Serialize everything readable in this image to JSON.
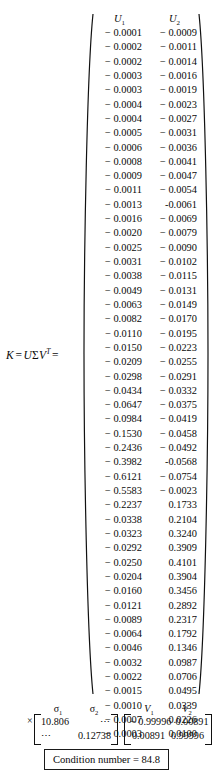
{
  "equation": {
    "label_k": "K",
    "equals": "=",
    "label_u": "U",
    "label_sigma": "Σ",
    "label_v": "V",
    "transpose": "T",
    "equals2": "="
  },
  "u_matrix": {
    "headers": [
      "U",
      "U"
    ],
    "header_subs": [
      "1",
      "2"
    ],
    "rows": [
      [
        "− 0.0001",
        "− 0.0009"
      ],
      [
        "− 0.0002",
        "− 0.0011"
      ],
      [
        "− 0.0002",
        "− 0.0014"
      ],
      [
        "− 0.0003",
        "− 0.0016"
      ],
      [
        "− 0.0003",
        "− 0.0019"
      ],
      [
        "− 0.0004",
        "− 0.0023"
      ],
      [
        "− 0.0004",
        "− 0.0027"
      ],
      [
        "− 0.0005",
        "− 0.0031"
      ],
      [
        "− 0.0006",
        "− 0.0036"
      ],
      [
        "− 0.0008",
        "− 0.0041"
      ],
      [
        "− 0.0009",
        "− 0.0047"
      ],
      [
        "− 0.0011",
        "− 0.0054"
      ],
      [
        "− 0.0013",
        "-0.0061"
      ],
      [
        "− 0.0016",
        "− 0.0069"
      ],
      [
        "− 0.0020",
        "− 0.0079"
      ],
      [
        "− 0.0025",
        "− 0.0090"
      ],
      [
        "− 0.0031",
        "− 0.0102"
      ],
      [
        "− 0.0038",
        "− 0.0115"
      ],
      [
        "− 0.0049",
        "− 0.0131"
      ],
      [
        "− 0.0063",
        "− 0.0149"
      ],
      [
        "− 0.0082",
        "− 0.0170"
      ],
      [
        "− 0.0110",
        "− 0.0195"
      ],
      [
        "− 0.0150",
        "− 0.0223"
      ],
      [
        "− 0.0209",
        "− 0.0255"
      ],
      [
        "− 0.0298",
        "− 0.0291"
      ],
      [
        "− 0.0434",
        "− 0.0332"
      ],
      [
        "− 0.0647",
        "− 0.0375"
      ],
      [
        "− 0.0984",
        "− 0.0419"
      ],
      [
        "− 0.1530",
        "− 0.0458"
      ],
      [
        "− 0.2436",
        "− 0.0492"
      ],
      [
        "− 0.3982",
        "-0.0568"
      ],
      [
        "− 0.6121",
        "− 0.0754"
      ],
      [
        "− 0.5583",
        "− 0.0023"
      ],
      [
        "− 0.2237",
        "0.1733"
      ],
      [
        "− 0.0338",
        "0.2104"
      ],
      [
        "− 0.0323",
        "0.3240"
      ],
      [
        "− 0.0292",
        "0.3909"
      ],
      [
        "− 0.0250",
        "0.4101"
      ],
      [
        "− 0.0204",
        "0.3904"
      ],
      [
        "− 0.0160",
        "0.3456"
      ],
      [
        "− 0.0121",
        "0.2892"
      ],
      [
        "− 0.0089",
        "0.2317"
      ],
      [
        "− 0.0064",
        "0.1792"
      ],
      [
        "− 0.0046",
        "0.1346"
      ],
      [
        "− 0.0032",
        "0.0987"
      ],
      [
        "− 0.0022",
        "0.0706"
      ],
      [
        "− 0.0015",
        "0.0495"
      ],
      [
        "− 0.0010",
        "0.0339"
      ],
      [
        "− 0.0007",
        "0.0226"
      ],
      [
        "− 0.0003",
        "0.0100"
      ]
    ]
  },
  "multiply_sign": "×",
  "sigma_matrix": {
    "headers": [
      "σ",
      "σ"
    ],
    "header_subs": [
      "1",
      "2"
    ],
    "rows": [
      [
        "10.806",
        "⋯"
      ],
      [
        "⋯",
        "0.12738"
      ]
    ]
  },
  "v_matrix": {
    "headers": [
      "V",
      "V"
    ],
    "header_subs": [
      "1",
      "2"
    ],
    "rows": [
      [
        "− 0.99996",
        "0.00891"
      ],
      [
        "0.00891",
        "0.99996"
      ]
    ]
  },
  "condition": {
    "text": "Condition number  =  84.8"
  },
  "chart_data": {
    "type": "table",
    "u_columns": [
      "U1",
      "U2"
    ],
    "u_values": [
      [
        -0.0001,
        -0.0009
      ],
      [
        -0.0002,
        -0.0011
      ],
      [
        -0.0002,
        -0.0014
      ],
      [
        -0.0003,
        -0.0016
      ],
      [
        -0.0003,
        -0.0019
      ],
      [
        -0.0004,
        -0.0023
      ],
      [
        -0.0004,
        -0.0027
      ],
      [
        -0.0005,
        -0.0031
      ],
      [
        -0.0006,
        -0.0036
      ],
      [
        -0.0008,
        -0.0041
      ],
      [
        -0.0009,
        -0.0047
      ],
      [
        -0.0011,
        -0.0054
      ],
      [
        -0.0013,
        -0.0061
      ],
      [
        -0.0016,
        -0.0069
      ],
      [
        -0.002,
        -0.0079
      ],
      [
        -0.0025,
        -0.009
      ],
      [
        -0.0031,
        -0.0102
      ],
      [
        -0.0038,
        -0.0115
      ],
      [
        -0.0049,
        -0.0131
      ],
      [
        -0.0063,
        -0.0149
      ],
      [
        -0.0082,
        -0.017
      ],
      [
        -0.011,
        -0.0195
      ],
      [
        -0.015,
        -0.0223
      ],
      [
        -0.0209,
        -0.0255
      ],
      [
        -0.0298,
        -0.0291
      ],
      [
        -0.0434,
        -0.0332
      ],
      [
        -0.0647,
        -0.0375
      ],
      [
        -0.0984,
        -0.0419
      ],
      [
        -0.153,
        -0.0458
      ],
      [
        -0.2436,
        -0.0492
      ],
      [
        -0.3982,
        -0.0568
      ],
      [
        -0.6121,
        -0.0754
      ],
      [
        -0.5583,
        -0.0023
      ],
      [
        -0.2237,
        0.1733
      ],
      [
        -0.0338,
        0.2104
      ],
      [
        -0.0323,
        0.324
      ],
      [
        -0.0292,
        0.3909
      ],
      [
        -0.025,
        0.4101
      ],
      [
        -0.0204,
        0.3904
      ],
      [
        -0.016,
        0.3456
      ],
      [
        -0.0121,
        0.2892
      ],
      [
        -0.0089,
        0.2317
      ],
      [
        -0.0064,
        0.1792
      ],
      [
        -0.0046,
        0.1346
      ],
      [
        -0.0032,
        0.0987
      ],
      [
        -0.0022,
        0.0706
      ],
      [
        -0.0015,
        0.0495
      ],
      [
        -0.001,
        0.0339
      ],
      [
        -0.0007,
        0.0226
      ],
      [
        -0.0003,
        0.01
      ]
    ],
    "singular_values": [
      10.806,
      0.12738
    ],
    "v_columns": [
      "V1",
      "V2"
    ],
    "v_values": [
      [
        -0.99996,
        0.00891
      ],
      [
        0.00891,
        0.99996
      ]
    ],
    "condition_number": 84.8
  }
}
